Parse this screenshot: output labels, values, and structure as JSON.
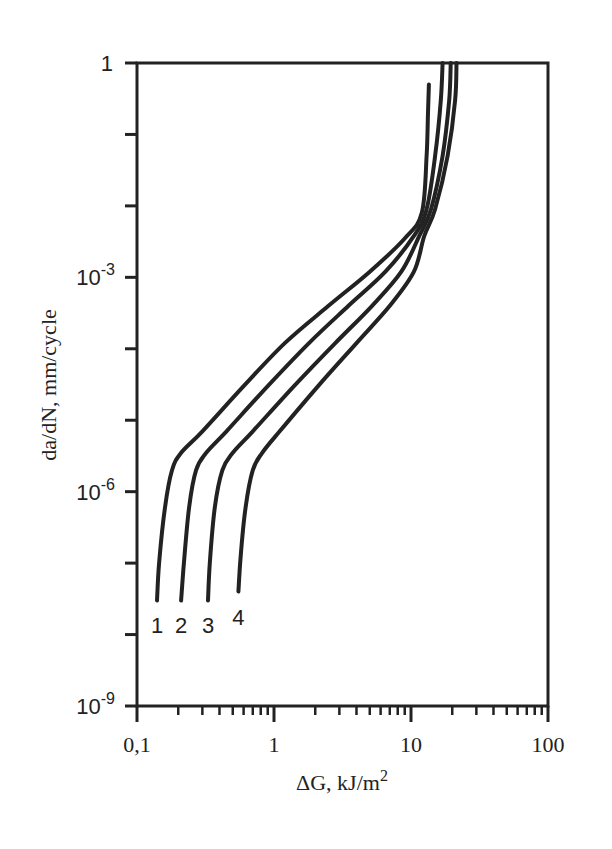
{
  "chart_data": {
    "type": "line",
    "title": "",
    "xlabel": "ΔG, kJ/m",
    "xlabel_superscript": "2",
    "ylabel": "da/dN, mm/cycle",
    "xscale": "log",
    "yscale": "log",
    "xlim": [
      0.1,
      100
    ],
    "ylim": [
      1e-09,
      1
    ],
    "grid": false,
    "legend": "inline curve labels at lower ends",
    "x_tick_labels": [
      "0,1",
      "1",
      "10",
      "100"
    ],
    "x_ticks": [
      0.1,
      1,
      10,
      100
    ],
    "y_ticks": [
      {
        "value": 1,
        "base": "1",
        "exp": ""
      },
      {
        "value": 0.001,
        "base": "10",
        "exp": "-3"
      },
      {
        "value": 1e-06,
        "base": "10",
        "exp": "-6"
      },
      {
        "value": 1e-09,
        "base": "10",
        "exp": "-9"
      }
    ],
    "series": [
      {
        "name": "1",
        "label": "1",
        "x": [
          0.14,
          0.145,
          0.16,
          0.18,
          0.21,
          0.3,
          0.6,
          1.2,
          2.5,
          5,
          9,
          12,
          13,
          13.3,
          13.5
        ],
        "y": [
          3e-08,
          1e-07,
          6e-07,
          2e-06,
          3.5e-06,
          7e-06,
          3e-05,
          0.00012,
          0.0004,
          0.0012,
          0.0035,
          0.008,
          0.05,
          0.2,
          0.5
        ]
      },
      {
        "name": "2",
        "label": "2",
        "x": [
          0.21,
          0.22,
          0.24,
          0.27,
          0.32,
          0.45,
          0.9,
          1.8,
          3.5,
          6.5,
          10.5,
          13,
          15,
          16.5,
          17
        ],
        "y": [
          3e-08,
          1e-07,
          6e-07,
          2e-06,
          3.5e-06,
          7e-06,
          3e-05,
          0.00012,
          0.0004,
          0.0012,
          0.0038,
          0.009,
          0.05,
          0.3,
          1
        ]
      },
      {
        "name": "3",
        "label": "3",
        "x": [
          0.33,
          0.34,
          0.37,
          0.42,
          0.5,
          0.7,
          1.4,
          2.8,
          5.2,
          8.5,
          11.5,
          14,
          17,
          19,
          19.5
        ],
        "y": [
          3e-08,
          1e-07,
          6e-07,
          2e-06,
          3.5e-06,
          7e-06,
          3e-05,
          0.00012,
          0.0004,
          0.0012,
          0.0038,
          0.009,
          0.05,
          0.3,
          1
        ]
      },
      {
        "name": "4",
        "label": "4",
        "x": [
          0.55,
          0.57,
          0.62,
          0.7,
          0.82,
          1.1,
          2.1,
          4,
          7,
          10.5,
          12.5,
          15,
          18.5,
          21,
          21.5
        ],
        "y": [
          4e-08,
          1.2e-07,
          6e-07,
          2e-06,
          3.5e-06,
          7e-06,
          3e-05,
          0.00012,
          0.0004,
          0.0012,
          0.0038,
          0.009,
          0.05,
          0.3,
          1
        ]
      }
    ]
  }
}
